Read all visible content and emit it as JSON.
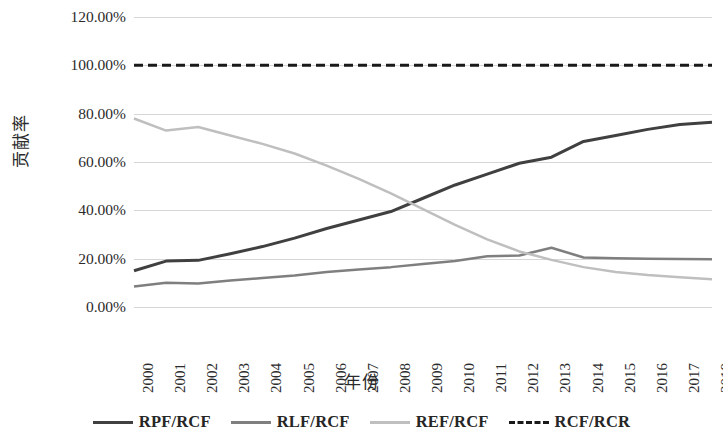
{
  "chart_data": {
    "type": "line",
    "title": "",
    "xlabel": "年份",
    "ylabel": "贡献率",
    "x": [
      2000,
      2001,
      2002,
      2003,
      2004,
      2005,
      2006,
      2007,
      2008,
      2009,
      2010,
      2011,
      2012,
      2013,
      2014,
      2015,
      2016,
      2017,
      2018
    ],
    "categories": [
      "2000",
      "2001",
      "2002",
      "2003",
      "2004",
      "2005",
      "2006",
      "2007",
      "2008",
      "2009",
      "2010",
      "2011",
      "2012",
      "2013",
      "2014",
      "2015",
      "2016",
      "2017",
      "2018"
    ],
    "ylim": [
      0,
      120
    ],
    "xlim": [
      2000,
      2018
    ],
    "y_tick_labels": [
      "120.00%",
      "100.00%",
      "80.00%",
      "60.00%",
      "40.00%",
      "20.00%",
      "0.00%"
    ],
    "y_tick_values": [
      120,
      100,
      80,
      60,
      40,
      20,
      0
    ],
    "grid": true,
    "legend_position": "bottom",
    "series": [
      {
        "name": "RPF/RCF",
        "color": "#404040",
        "style": "solid",
        "width": 3,
        "values": [
          15.0,
          19.0,
          19.3,
          22.0,
          25.0,
          28.5,
          32.5,
          36.0,
          39.5,
          45.0,
          50.5,
          55.0,
          59.5,
          62.0,
          68.5,
          71.0,
          73.5,
          75.5,
          76.5
        ]
      },
      {
        "name": "RLF/RCF",
        "color": "#7f7f7f",
        "style": "solid",
        "width": 2.5,
        "values": [
          8.5,
          10.0,
          9.7,
          11.0,
          12.0,
          13.0,
          14.5,
          15.5,
          16.5,
          17.8,
          19.0,
          21.0,
          21.3,
          24.5,
          20.5,
          20.2,
          20.0,
          19.9,
          19.8
        ]
      },
      {
        "name": "REF/RCF",
        "color": "#bfbfbf",
        "style": "solid",
        "width": 2.5,
        "values": [
          78.0,
          73.0,
          74.5,
          71.0,
          67.5,
          63.5,
          58.5,
          53.0,
          47.0,
          40.5,
          34.0,
          28.0,
          23.0,
          19.5,
          16.5,
          14.5,
          13.2,
          12.3,
          11.5
        ]
      },
      {
        "name": "RCF/RCR",
        "color": "#1a1a1a",
        "style": "dashed",
        "width": 3,
        "values": [
          100,
          100,
          100,
          100,
          100,
          100,
          100,
          100,
          100,
          100,
          100,
          100,
          100,
          100,
          100,
          100,
          100,
          100,
          100
        ]
      }
    ]
  }
}
